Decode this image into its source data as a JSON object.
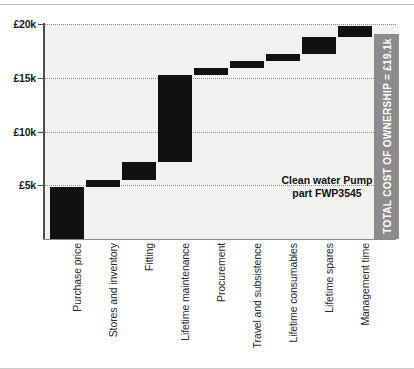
{
  "chart_data": {
    "type": "bar",
    "subtype": "waterfall",
    "title": "",
    "xlabel": "",
    "ylabel": "",
    "ylim": [
      0,
      20000
    ],
    "yticks": [
      5000,
      10000,
      15000,
      20000
    ],
    "ytick_labels": [
      "£5k",
      "£10k",
      "£15k",
      "£20k"
    ],
    "currency": "GBP",
    "units": "£",
    "grid": true,
    "legend": false,
    "categories": [
      "Purchase price",
      "Stores and inventory",
      "Fitting",
      "Lifetime maintenance",
      "Procurement",
      "Travel and subsistence",
      "Lifetime consumables",
      "Lifetime spares",
      "Management time"
    ],
    "values": [
      4850,
      600,
      1750,
      8050,
      650,
      650,
      650,
      1550,
      1100
    ],
    "cumulative_start": [
      0,
      4850,
      5450,
      7200,
      15250,
      15900,
      16550,
      17200,
      18750
    ],
    "cumulative_end": [
      4850,
      5450,
      7200,
      15250,
      15900,
      16550,
      17200,
      18750,
      19850
    ],
    "total": 19100,
    "total_label": "TOTAL COST OF OWNERSHIP = £19.1k",
    "annotation_line1": "Clean water Pump",
    "annotation_line2": "part FWP3545",
    "colors": {
      "bar": "#111111",
      "total_bar": "#8c8c8c",
      "plot_background": "#f2f2f1",
      "gridline": "#8d8d8d",
      "axis": "#4d4d4d",
      "total_label_text": "#ffffff"
    }
  },
  "yaxis": {
    "ticks": [
      {
        "label": "£20k",
        "value": 20000
      },
      {
        "label": "£15k",
        "value": 15000
      },
      {
        "label": "£10k",
        "value": 10000
      },
      {
        "label": "£5k",
        "value": 5000
      }
    ]
  },
  "bars": [
    {
      "label": "Purchase price",
      "start": 0,
      "end": 4850
    },
    {
      "label": "Stores and inventory",
      "start": 4850,
      "end": 5450
    },
    {
      "label": "Fitting",
      "start": 5450,
      "end": 7200
    },
    {
      "label": "Lifetime maintenance",
      "start": 7200,
      "end": 15250
    },
    {
      "label": "Procurement",
      "start": 15250,
      "end": 15900
    },
    {
      "label": "Travel and subsistence",
      "start": 15900,
      "end": 16550
    },
    {
      "label": "Lifetime consumables",
      "start": 16550,
      "end": 17200
    },
    {
      "label": "Lifetime spares",
      "start": 17200,
      "end": 18750
    },
    {
      "label": "Management time",
      "start": 18750,
      "end": 19850
    }
  ],
  "total_bar": {
    "label": "TOTAL COST OF OWNERSHIP = £19.1k",
    "value": 19100
  },
  "annotation": {
    "line1": "Clean water Pump",
    "line2": "part FWP3545"
  }
}
